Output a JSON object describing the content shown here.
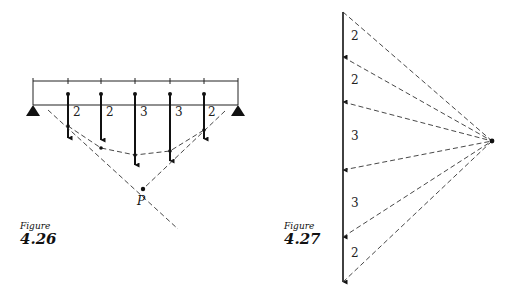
{
  "figure_426": {
    "caption_word": "Figure",
    "caption_number": "4.26",
    "description": "Simply supported beam with five downward point loads, funicular (string) polygon and resultant intersection point P",
    "loads": [
      {
        "label": "2",
        "x": 68
      },
      {
        "label": "2",
        "x": 101
      },
      {
        "label": "3",
        "x": 135
      },
      {
        "label": "3",
        "x": 170
      },
      {
        "label": "2",
        "x": 204
      }
    ],
    "point_label": "P"
  },
  "figure_427": {
    "caption_word": "Figure",
    "caption_number": "4.27",
    "description": "Force polygon (load line) with rays to a pole",
    "segments": [
      {
        "label": "2"
      },
      {
        "label": "2"
      },
      {
        "label": "3"
      },
      {
        "label": "3"
      },
      {
        "label": "2"
      }
    ]
  }
}
